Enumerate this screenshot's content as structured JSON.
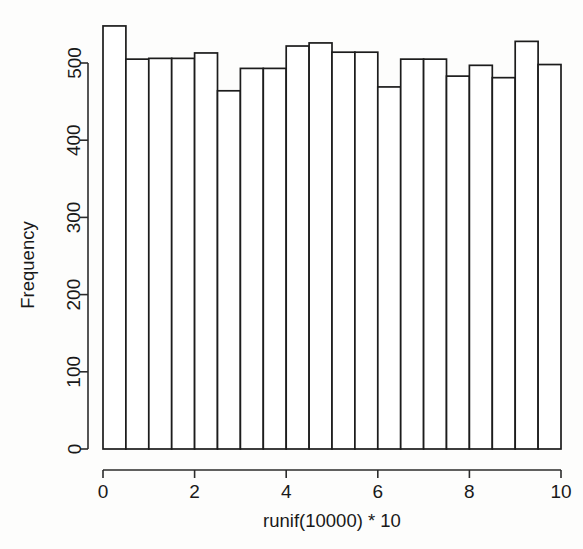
{
  "figure": {
    "kind": "r-base-histogram",
    "background_color": "#fdfdfc",
    "ink_color": "#1c1c1c",
    "bar_fill_color": "#ffffff"
  },
  "axes": {
    "x": {
      "title": "runif(10000) * 10",
      "tick_labels": [
        "0",
        "2",
        "4",
        "6",
        "8",
        "10"
      ],
      "tick_values": [
        0,
        2,
        4,
        6,
        8,
        10
      ],
      "min": 0,
      "max": 10
    },
    "y": {
      "title": "Frequency",
      "tick_labels": [
        "0",
        "100",
        "200",
        "300",
        "400",
        "500"
      ],
      "tick_values": [
        0,
        100,
        200,
        300,
        400,
        500
      ],
      "min": 0,
      "max": 560
    }
  },
  "chart_data": {
    "type": "bar",
    "title": "",
    "subtitle": "",
    "xlabel": "runif(10000) * 10",
    "ylabel": "Frequency",
    "xlim": [
      0,
      10
    ],
    "ylim": [
      0,
      560
    ],
    "grid": false,
    "legend": false,
    "bin_width": 0.5,
    "bin_count": 20,
    "total_count": 10000,
    "bin_edges": [
      0,
      0.5,
      1,
      1.5,
      2,
      2.5,
      3,
      3.5,
      4,
      4.5,
      5,
      5.5,
      6,
      6.5,
      7,
      7.5,
      8,
      8.5,
      9,
      9.5,
      10
    ],
    "categories": [
      "0-0.5",
      "0.5-1",
      "1-1.5",
      "1.5-2",
      "2-2.5",
      "2.5-3",
      "3-3.5",
      "3.5-4",
      "4-4.5",
      "4.5-5",
      "5-5.5",
      "5.5-6",
      "6-6.5",
      "6.5-7",
      "7-7.5",
      "7.5-8",
      "8-8.5",
      "8.5-9",
      "9-9.5",
      "9.5-10"
    ],
    "values": [
      548,
      505,
      506,
      506,
      513,
      464,
      493,
      493,
      522,
      526,
      514,
      514,
      469,
      505,
      505,
      483,
      497,
      481,
      528,
      498
    ],
    "x_tick_labels": [
      "0",
      "2",
      "4",
      "6",
      "8",
      "10"
    ],
    "x_tick_values": [
      0,
      2,
      4,
      6,
      8,
      10
    ],
    "y_tick_labels": [
      "0",
      "100",
      "200",
      "300",
      "400",
      "500"
    ],
    "y_tick_values": [
      0,
      100,
      200,
      300,
      400,
      500
    ]
  }
}
